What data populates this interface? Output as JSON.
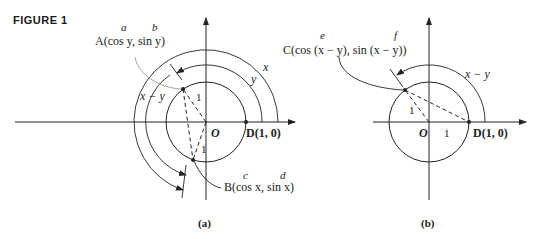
{
  "figure_label": "FIGURE 1",
  "panel_a": {
    "caption": "(a)",
    "label_a": "a",
    "label_b": "b",
    "point_A": "A(cos y, sin y)",
    "label_c": "c",
    "label_d": "d",
    "point_B": "B(cos x, sin x)",
    "origin": "O",
    "point_D": "D(1, 0)",
    "arc_x": "x",
    "arc_y": "y",
    "arc_x_minus_y": "x − y",
    "radius_label_1": "1",
    "radius_label_2": "1"
  },
  "panel_b": {
    "caption": "(b)",
    "label_e": "e",
    "label_f": "f",
    "point_C": "C(cos (x − y), sin (x − y))",
    "origin": "O",
    "point_D": "D(1, 0)",
    "arc_x_minus_y": "x − y",
    "radius_label_1": "1",
    "radius_label_2": "1"
  }
}
